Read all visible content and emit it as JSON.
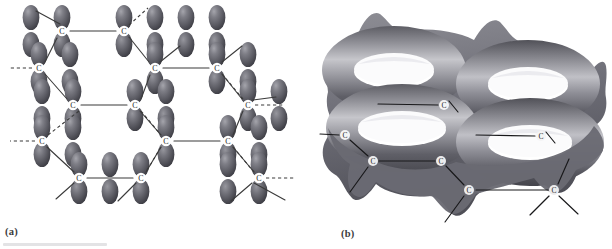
{
  "figure": {
    "background_color": "#ffffff",
    "width": 612,
    "height": 249,
    "bottom_rule_color": "#e3e3e5"
  },
  "panels": [
    {
      "id": "a",
      "caption": "(a)",
      "description": "Hexagonal carbon sheet drawn with individual unhybridized p orbitals shown as paired lobes above and below each carbon atom",
      "atom_label": "C",
      "bond_style_solid": "solid",
      "bond_style_dashed": "dashed",
      "lobe_color_dark": "#4a4a50",
      "lobe_color_mid": "#6e6e76",
      "lobe_highlight": "#a9a9b0",
      "bond_color": "#3a3a3a",
      "atom_circle_fill": "#ffffff"
    },
    {
      "id": "b",
      "caption": "(b)",
      "description": "Same hexagonal carbon sheet with the p orbitals merged into continuous doughnut shaped pi electron clouds above and below the plane",
      "atom_label": "C",
      "cloud_color_dark": "#4e4e54",
      "cloud_color_mid": "#8a8a90",
      "cloud_highlight": "#d2d2d6",
      "bond_color": "#1f1f1f",
      "atom_circle_fill": "#f2f2f2"
    }
  ],
  "panel_a": {
    "caption": "(a)",
    "atoms": [
      {
        "label": "C",
        "x": 62,
        "y": 31
      },
      {
        "label": "C",
        "x": 124,
        "y": 31
      },
      {
        "label": "C",
        "x": 39,
        "y": 68
      },
      {
        "label": "C",
        "x": 155,
        "y": 68
      },
      {
        "label": "C",
        "x": 217,
        "y": 68
      },
      {
        "label": "C",
        "x": 73,
        "y": 105
      },
      {
        "label": "C",
        "x": 135,
        "y": 105
      },
      {
        "label": "C",
        "x": 248,
        "y": 105
      },
      {
        "label": "C",
        "x": 42,
        "y": 141
      },
      {
        "label": "C",
        "x": 166,
        "y": 141
      },
      {
        "label": "C",
        "x": 228,
        "y": 141
      },
      {
        "label": "C",
        "x": 79,
        "y": 178
      },
      {
        "label": "C",
        "x": 141,
        "y": 178
      },
      {
        "label": "C",
        "x": 259,
        "y": 178
      }
    ],
    "solid_bonds": [
      [
        62,
        31,
        124,
        31
      ],
      [
        155,
        68,
        217,
        68
      ],
      [
        73,
        105,
        135,
        105
      ],
      [
        166,
        141,
        228,
        141
      ],
      [
        79,
        178,
        141,
        178
      ],
      [
        39,
        68,
        62,
        31
      ],
      [
        39,
        68,
        73,
        105
      ],
      [
        124,
        31,
        155,
        68
      ],
      [
        135,
        105,
        155,
        68
      ],
      [
        217,
        68,
        248,
        105
      ],
      [
        42,
        141,
        79,
        178
      ],
      [
        135,
        105,
        166,
        141
      ],
      [
        228,
        141,
        248,
        105
      ],
      [
        141,
        178,
        166,
        141
      ],
      [
        259,
        178,
        228,
        141
      ]
    ],
    "dashed_bonds": [
      [
        62,
        31,
        42,
        0
      ],
      [
        124,
        31,
        148,
        5
      ],
      [
        39,
        68,
        8,
        68
      ],
      [
        73,
        105,
        42,
        141
      ],
      [
        42,
        141,
        8,
        141
      ],
      [
        248,
        105,
        284,
        105
      ],
      [
        259,
        178,
        295,
        178
      ],
      [
        166,
        141,
        141,
        178
      ],
      [
        217,
        68,
        248,
        105
      ]
    ],
    "free_bonds": [
      [
        62,
        31,
        34,
        12
      ],
      [
        124,
        31,
        150,
        8
      ],
      [
        155,
        68,
        182,
        44
      ],
      [
        248,
        105,
        280,
        104
      ],
      [
        79,
        178,
        54,
        200
      ],
      [
        141,
        178,
        116,
        202
      ],
      [
        259,
        178,
        288,
        200
      ],
      [
        259,
        178,
        232,
        200
      ]
    ]
  },
  "panel_b": {
    "caption": "(b)",
    "atoms": [
      {
        "label": "C",
        "x": 138,
        "y": 105
      },
      {
        "label": "C",
        "x": 39,
        "y": 135
      },
      {
        "label": "C",
        "x": 235,
        "y": 136
      },
      {
        "label": "C",
        "x": 67,
        "y": 161
      },
      {
        "label": "C",
        "x": 135,
        "y": 161
      },
      {
        "label": "C",
        "x": 163,
        "y": 190
      },
      {
        "label": "C",
        "x": 248,
        "y": 190
      }
    ],
    "bonds": [
      [
        39,
        135,
        14,
        134
      ],
      [
        39,
        135,
        67,
        161
      ],
      [
        67,
        161,
        135,
        161
      ],
      [
        135,
        161,
        163,
        190
      ],
      [
        163,
        190,
        248,
        190
      ],
      [
        138,
        105,
        72,
        104
      ],
      [
        235,
        136,
        170,
        135
      ],
      [
        67,
        161,
        44,
        192
      ],
      [
        163,
        190,
        140,
        222
      ],
      [
        248,
        190,
        272,
        213
      ],
      [
        248,
        190,
        224,
        214
      ],
      [
        138,
        105,
        150,
        119
      ],
      [
        235,
        136,
        247,
        150
      ],
      [
        248,
        190,
        262,
        160
      ]
    ]
  }
}
